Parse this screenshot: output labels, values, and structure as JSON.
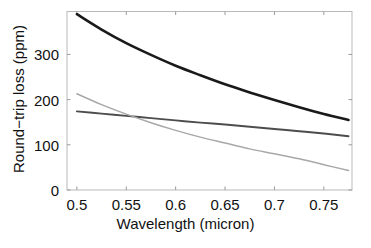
{
  "chart_data": {
    "type": "line",
    "title": "",
    "xlabel": "Wavelength (micron)",
    "ylabel": "Round−trip loss (ppm)",
    "xlim": [
      0.49,
      0.7785
    ],
    "ylim": [
      0,
      395
    ],
    "xticks": [
      0.5,
      0.55,
      0.6,
      0.65,
      0.7,
      0.75
    ],
    "xtick_labels": [
      "0.5",
      "0.55",
      "0.6",
      "0.65",
      "0.7",
      "0.75"
    ],
    "yticks": [
      0,
      100,
      200,
      300
    ],
    "ytick_labels": [
      "0",
      "100",
      "200",
      "300"
    ],
    "grid": false,
    "legend": "none",
    "x": [
      0.5,
      0.525,
      0.55,
      0.575,
      0.6,
      0.625,
      0.65,
      0.675,
      0.7,
      0.725,
      0.75,
      0.775
    ],
    "series": [
      {
        "name": "upper-curve",
        "color": "#1a1a1a",
        "linewidth": 2.6,
        "values": [
          389,
          355,
          325,
          299,
          275,
          254,
          234,
          216,
          199,
          183,
          168,
          155
        ]
      },
      {
        "name": "middle-curve",
        "color": "#4d4d4d",
        "linewidth": 1.9,
        "values": [
          174,
          169,
          164,
          159,
          154,
          149,
          145,
          140,
          135,
          130,
          125,
          119
        ]
      },
      {
        "name": "lower-curve",
        "color": "#a8a8a8",
        "linewidth": 1.5,
        "values": [
          213,
          189,
          168,
          149,
          132,
          117,
          104,
          91,
          80,
          69,
          56,
          43
        ]
      }
    ]
  },
  "axes": {
    "frame_color": "#b9b9b9",
    "tick_color": "#9a9a9a",
    "background": "#ffffff"
  }
}
